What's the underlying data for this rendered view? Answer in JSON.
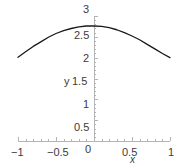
{
  "chart_data": {
    "type": "line",
    "title": "",
    "xlabel": "x",
    "ylabel": "y",
    "xlim": [
      -1,
      1
    ],
    "ylim": [
      0,
      3
    ],
    "grid": false,
    "legend": null,
    "x_ticks": [
      {
        "value": -1,
        "label": "−1"
      },
      {
        "value": -0.5,
        "label": "−0.5"
      },
      {
        "value": 0,
        "label": "0"
      },
      {
        "value": 0.5,
        "label": "0.5"
      },
      {
        "value": 1,
        "label": "1"
      }
    ],
    "y_ticks": [
      {
        "value": 0.5,
        "label": "0.5"
      },
      {
        "value": 1,
        "label": "1"
      },
      {
        "value": 1.5,
        "label": "1.5"
      },
      {
        "value": 2,
        "label": "2"
      },
      {
        "value": 2.5,
        "label": "2.5"
      },
      {
        "value": 3,
        "label": "3"
      }
    ],
    "y_minor_tick_step": 0.1,
    "series": [
      {
        "name": "curve",
        "color": "#1a1a1a",
        "x": [
          -1.0,
          -0.9,
          -0.8,
          -0.7,
          -0.6,
          -0.5,
          -0.4,
          -0.3,
          -0.2,
          -0.1,
          0.0,
          0.1,
          0.2,
          0.3,
          0.4,
          0.5,
          0.6,
          0.7,
          0.8,
          0.9,
          1.0
        ],
        "y": [
          2.01,
          2.14,
          2.27,
          2.38,
          2.49,
          2.58,
          2.65,
          2.7,
          2.74,
          2.76,
          2.76,
          2.75,
          2.72,
          2.67,
          2.6,
          2.52,
          2.43,
          2.32,
          2.21,
          2.1,
          2.0
        ]
      }
    ],
    "axis_color": "#b5b5b5",
    "tick_text_color": "#3b3b3b",
    "background": "#ffffff"
  },
  "axes": {
    "x_axis_name": "x",
    "y_axis_name": "y"
  }
}
